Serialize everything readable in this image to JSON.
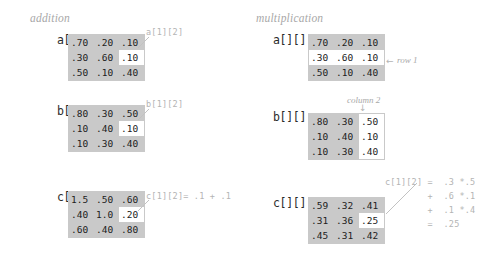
{
  "figure": {
    "sections": [
      {
        "id": "addition",
        "title": "addition",
        "matrices": [
          {
            "name": "a[][]",
            "rows": [
              [
                ".70",
                ".20",
                ".10"
              ],
              [
                ".30",
                ".60",
                ".10"
              ],
              [
                ".50",
                ".10",
                ".40"
              ]
            ],
            "highlight": {
              "kind": "cell",
              "row": 1,
              "col": 2
            },
            "annotation": "a[1][2]"
          },
          {
            "name": "b[][]",
            "rows": [
              [
                ".80",
                ".30",
                ".50"
              ],
              [
                ".10",
                ".40",
                ".10"
              ],
              [
                ".10",
                ".30",
                ".40"
              ]
            ],
            "highlight": {
              "kind": "cell",
              "row": 1,
              "col": 2
            },
            "annotation": "b[1][2]"
          },
          {
            "name": "c[][]",
            "rows": [
              [
                "1.5",
                ".50",
                ".60"
              ],
              [
                ".40",
                "1.0",
                ".20"
              ],
              [
                ".60",
                ".40",
                ".80"
              ]
            ],
            "highlight": {
              "kind": "cell",
              "row": 1,
              "col": 2
            },
            "annotation": "c[1][2]= .1 + .1"
          }
        ]
      },
      {
        "id": "multiplication",
        "title": "multiplication",
        "matrices": [
          {
            "name": "a[][]",
            "rows": [
              [
                ".70",
                ".20",
                ".10"
              ],
              [
                ".30",
                ".60",
                ".10"
              ],
              [
                ".50",
                ".10",
                ".40"
              ]
            ],
            "highlight": {
              "kind": "row",
              "row": 1
            },
            "annotation": "row 1",
            "annotation_arrow": "←"
          },
          {
            "name": "b[][]",
            "rows": [
              [
                ".80",
                ".30",
                ".50"
              ],
              [
                ".10",
                ".40",
                ".10"
              ],
              [
                ".10",
                ".30",
                ".40"
              ]
            ],
            "highlight": {
              "kind": "col",
              "col": 2
            },
            "annotation": "column 2",
            "annotation_arrow": "↓"
          },
          {
            "name": "c[][]",
            "rows": [
              [
                ".59",
                ".32",
                ".41"
              ],
              [
                ".31",
                ".36",
                ".25"
              ],
              [
                ".45",
                ".31",
                ".42"
              ]
            ],
            "highlight": {
              "kind": "cell",
              "row": 1,
              "col": 2
            },
            "annotation_lines": [
              "c[1][2] =  .3 *.5",
              "        +  .6 *.1",
              "        +  .1 *.4",
              "        =  .25"
            ]
          }
        ]
      }
    ],
    "colors": {
      "matrix_background": "#c9c9c9",
      "highlight_background": "#ffffff",
      "annotation_text": "#b4b4b4",
      "title_text": "#a8a8a8",
      "cell_text": "#1c1c1c",
      "leader_line": "#c2c2c2",
      "page_background": "#ffffff"
    }
  }
}
